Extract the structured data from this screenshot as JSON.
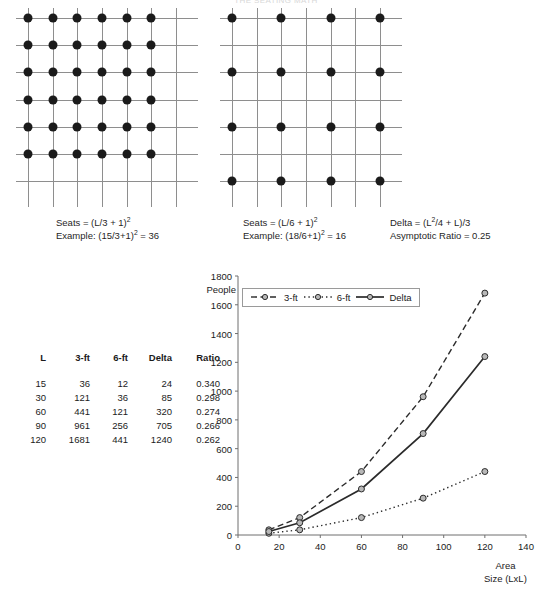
{
  "page": {
    "top_title": "THE SEATING MATH"
  },
  "figures": {
    "left_grid": {
      "name": "3-ft spacing grid",
      "cols": 7,
      "rows": 7,
      "dot_step": 1,
      "dot_cols": 6,
      "dot_rows": 6
    },
    "right_grid": {
      "name": "6-ft spacing grid",
      "cols": 7,
      "rows": 7,
      "dot_step": 2,
      "dot_cols": 4,
      "dot_rows": 4
    }
  },
  "captions": {
    "left": {
      "formula_prefix": "Seats = (L/3 + 1)",
      "formula_sup": "2",
      "example_prefix": "Example: (15/3+1)",
      "example_sup": "2",
      "example_suffix": " = 36"
    },
    "middle": {
      "formula_prefix": "Seats = (L/6 + 1)",
      "formula_sup": "2",
      "example_prefix": "Example: (18/6+1)",
      "example_sup": "2",
      "example_suffix": " = 16"
    },
    "right": {
      "delta_prefix": "Delta = (L",
      "delta_sup": "2",
      "delta_suffix": "/4 + L)/3",
      "ratio_line": "Asymptotic Ratio = 0.25"
    }
  },
  "table": {
    "headers": [
      "L",
      "3-ft",
      "6-ft",
      "Delta",
      "Ratio"
    ],
    "rows": [
      [
        "15",
        "36",
        "12",
        "24",
        "0.340"
      ],
      [
        "30",
        "121",
        "36",
        "85",
        "0.298"
      ],
      [
        "60",
        "441",
        "121",
        "320",
        "0.274"
      ],
      [
        "90",
        "961",
        "256",
        "705",
        "0.266"
      ],
      [
        "120",
        "1681",
        "441",
        "1240",
        "0.262"
      ]
    ]
  },
  "chart_data": {
    "type": "line",
    "title": "",
    "xlabel": "Area\nSize (LxL)",
    "xlabel_line1": "Area",
    "xlabel_line2": "Size (LxL)",
    "ylabel": "People",
    "x": [
      15,
      30,
      60,
      90,
      120
    ],
    "xlim": [
      0,
      140
    ],
    "ylim": [
      0,
      1800
    ],
    "xticks": [
      "0",
      "20",
      "40",
      "60",
      "80",
      "100",
      "120",
      "140"
    ],
    "xtick_values": [
      0,
      20,
      40,
      60,
      80,
      100,
      120,
      140
    ],
    "yticks": [
      "0",
      "200",
      "400",
      "600",
      "800",
      "1000",
      "1200",
      "1400",
      "1600",
      "1800"
    ],
    "ytick_values": [
      0,
      200,
      400,
      600,
      800,
      1000,
      1200,
      1400,
      1600,
      1800
    ],
    "grid": false,
    "legend_position": "top-left inside plot",
    "series": [
      {
        "name": "3-ft",
        "style": "dashed",
        "values": [
          36,
          121,
          441,
          961,
          1681
        ]
      },
      {
        "name": "6-ft",
        "style": "dotted",
        "values": [
          12,
          36,
          121,
          256,
          441
        ]
      },
      {
        "name": "Delta",
        "style": "solid",
        "values": [
          24,
          85,
          320,
          705,
          1240
        ]
      }
    ],
    "colors": {
      "line": "#2b2b2b",
      "marker_fill": "#b8b8b8",
      "marker_stroke": "#2b2b2b"
    }
  }
}
